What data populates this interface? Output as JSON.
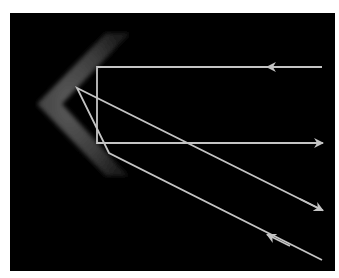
{
  "diagram": {
    "title": "",
    "description_visible": false,
    "colors": {
      "page_background": "#ffffff",
      "panel_background": "#000000",
      "ray_color": "#c4c4c4",
      "mirror_color_center": "#5a5a5a",
      "mirror_color_edge": "#1a1a1a"
    },
    "panel": {
      "x": 10,
      "y": 13,
      "width": 325,
      "height": 258
    },
    "mirror": {
      "name": "corner-reflector",
      "shape": "chevron",
      "points": [
        [
          130,
          33
        ],
        [
          106,
          33
        ],
        [
          37,
          104
        ],
        [
          106,
          176
        ],
        [
          128,
          176
        ],
        [
          62,
          104
        ]
      ]
    },
    "rays": [
      {
        "name": "ray-1-incoming-horizontal",
        "points": [
          [
            322,
            67
          ],
          [
            97,
            67
          ],
          [
            97,
            143
          ],
          [
            322,
            143
          ]
        ],
        "arrows": [
          {
            "at": [
              268,
              67
            ],
            "direction": "left"
          },
          {
            "at": [
              322,
              143
            ],
            "direction": "right"
          }
        ]
      },
      {
        "name": "ray-2-incoming-diagonal",
        "points": [
          [
            322,
            260
          ],
          [
            109,
            153
          ],
          [
            77,
            88
          ],
          [
            322,
            210
          ]
        ],
        "arrows": [
          {
            "at": [
              268,
              235
            ],
            "direction": "up-left"
          },
          {
            "at": [
              322,
              210
            ],
            "direction": "down-right"
          }
        ]
      }
    ]
  }
}
